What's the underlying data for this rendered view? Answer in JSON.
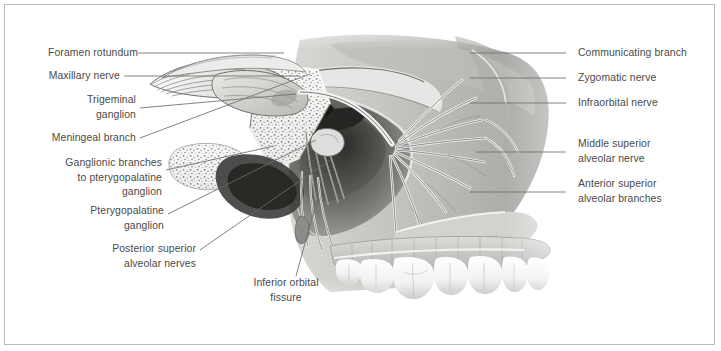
{
  "plate": {
    "title": "Maxillary nerve (CN V2) and its branches, lateral view",
    "border_color": "#b9b9b7",
    "background": "#ffffff",
    "text_color": "#4a4a48",
    "leader_color": "#6d6d6b"
  },
  "labels_left": [
    {
      "id": "foramen-rotundum",
      "text": "Foramen rotundum"
    },
    {
      "id": "maxillary-nerve",
      "text": "Maxillary nerve"
    },
    {
      "id": "trigeminal-ganglion",
      "text": "Trigeminal\nganglion"
    },
    {
      "id": "meningeal-branch",
      "text": "Meningeal branch"
    },
    {
      "id": "ganglionic-branches",
      "text": "Ganglionic branches\nto pterygopalatine\nganglion"
    },
    {
      "id": "pterygopalatine-ganglion",
      "text": "Pterygopalatine\nganglion"
    },
    {
      "id": "posterior-superior-alveolar-nerves",
      "text": "Posterior superior\nalveolar nerves"
    },
    {
      "id": "inferior-orbital-fissure",
      "text": "Inferior orbital\nfissure"
    }
  ],
  "labels_right": [
    {
      "id": "communicating-branch",
      "text": "Communicating branch"
    },
    {
      "id": "zygomatic-nerve",
      "text": "Zygomatic nerve"
    },
    {
      "id": "infraorbital-nerve",
      "text": "Infraorbital nerve"
    },
    {
      "id": "middle-superior-alveolar-nerve",
      "text": "Middle superior\nalveolar nerve"
    },
    {
      "id": "anterior-superior-alveolar-branches",
      "text": "Anterior superior\nalveolar branches"
    }
  ]
}
